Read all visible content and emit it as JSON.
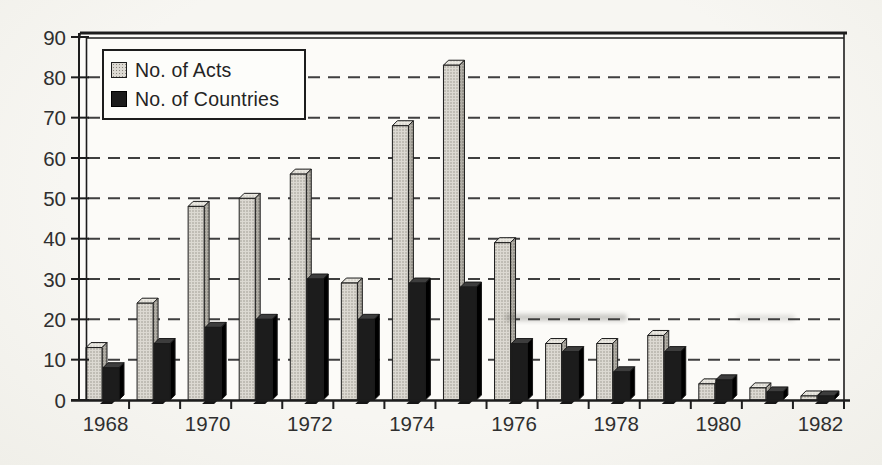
{
  "chart_data": {
    "type": "bar",
    "title": "",
    "categories": [
      "1968",
      "1969",
      "1970",
      "1971",
      "1972",
      "1973",
      "1974",
      "1975",
      "1976",
      "1977",
      "1978",
      "1979",
      "1980",
      "1981",
      "1982"
    ],
    "series": [
      {
        "name": "No. of Acts",
        "values": [
          13,
          24,
          48,
          50,
          56,
          29,
          68,
          83,
          39,
          14,
          14,
          16,
          4,
          3,
          1
        ]
      },
      {
        "name": "No. of Countries",
        "values": [
          8,
          14,
          18,
          20,
          30,
          20,
          29,
          28,
          14,
          12,
          7,
          12,
          5,
          2,
          1
        ]
      }
    ],
    "ylim": [
      0,
      90
    ],
    "yticks": [
      0,
      10,
      20,
      30,
      40,
      50,
      60,
      70,
      80,
      90
    ],
    "xtick_labels": [
      "1968",
      "1970",
      "1972",
      "1974",
      "1976",
      "1978",
      "1980",
      "1982"
    ],
    "grid": "horizontal-dashed",
    "legend": {
      "position": "top-left",
      "items": [
        "No. of Acts",
        "No. of Countries"
      ]
    },
    "style": {
      "acts_fill": "#dcd9d2",
      "acts_dot": "#8a877f",
      "countries_fill": "#1c1c1c",
      "grid_color": "#3f3f3f",
      "axis_color": "#1d1d1d",
      "text_color": "#2f2f2f",
      "paper_color": "#f4f3ef",
      "plot_color": "#fcfbf8"
    }
  }
}
